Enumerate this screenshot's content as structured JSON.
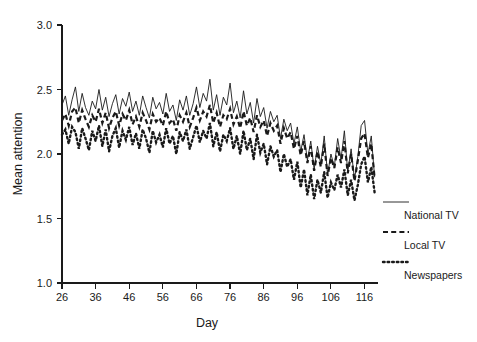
{
  "chart_data": {
    "type": "line",
    "title": "",
    "xlabel": "Day",
    "ylabel": "Mean attention",
    "xlim": [
      26,
      120
    ],
    "ylim": [
      1.0,
      3.0
    ],
    "yticks": [
      "1.0",
      "1.5",
      "2.0",
      "2.5",
      "3.0"
    ],
    "ytick_values": [
      1.0,
      1.5,
      2.0,
      2.5,
      3.0
    ],
    "xticks": [
      "26",
      "36",
      "46",
      "56",
      "66",
      "76",
      "86",
      "96",
      "106",
      "116"
    ],
    "xtick_values": [
      26,
      36,
      46,
      56,
      66,
      76,
      86,
      96,
      106,
      116
    ],
    "grid": false,
    "legend_position": "right",
    "x": [
      26,
      27,
      28,
      29,
      30,
      31,
      32,
      33,
      34,
      35,
      36,
      37,
      38,
      39,
      40,
      41,
      42,
      43,
      44,
      45,
      46,
      47,
      48,
      49,
      50,
      51,
      52,
      53,
      54,
      55,
      56,
      57,
      58,
      59,
      60,
      61,
      62,
      63,
      64,
      65,
      66,
      67,
      68,
      69,
      70,
      71,
      72,
      73,
      74,
      75,
      76,
      77,
      78,
      79,
      80,
      81,
      82,
      83,
      84,
      85,
      86,
      87,
      88,
      89,
      90,
      91,
      92,
      93,
      94,
      95,
      96,
      97,
      98,
      99,
      100,
      101,
      102,
      103,
      104,
      105,
      106,
      107,
      108,
      109,
      110,
      111,
      112,
      113,
      114,
      115,
      116,
      117,
      118,
      119
    ],
    "series": [
      {
        "name": "National TV",
        "style": "solid",
        "color": "#1a1a1a",
        "values": [
          2.38,
          2.45,
          2.3,
          2.42,
          2.52,
          2.33,
          2.47,
          2.36,
          2.3,
          2.41,
          2.35,
          2.5,
          2.34,
          2.44,
          2.29,
          2.39,
          2.46,
          2.31,
          2.43,
          2.37,
          2.48,
          2.33,
          2.41,
          2.3,
          2.45,
          2.36,
          2.28,
          2.44,
          2.35,
          2.4,
          2.31,
          2.47,
          2.33,
          2.38,
          2.26,
          2.42,
          2.34,
          2.45,
          2.3,
          2.39,
          2.52,
          2.36,
          2.47,
          2.41,
          2.58,
          2.34,
          2.46,
          2.3,
          2.44,
          2.38,
          2.55,
          2.32,
          2.41,
          2.28,
          2.49,
          2.31,
          2.4,
          2.24,
          2.43,
          2.29,
          2.36,
          2.2,
          2.33,
          2.25,
          2.3,
          2.12,
          2.27,
          2.18,
          2.24,
          2.08,
          2.21,
          2.02,
          2.15,
          1.95,
          2.1,
          1.88,
          2.06,
          1.92,
          2.14,
          1.84,
          2.0,
          1.9,
          2.12,
          1.96,
          2.18,
          1.86,
          2.04,
          1.8,
          1.98,
          2.22,
          2.26,
          2.0,
          2.14,
          1.82
        ]
      },
      {
        "name": "Local TV",
        "style": "dashed",
        "color": "#1a1a1a",
        "values": [
          2.26,
          2.31,
          2.22,
          2.33,
          2.36,
          2.24,
          2.34,
          2.27,
          2.21,
          2.3,
          2.25,
          2.35,
          2.24,
          2.32,
          2.2,
          2.28,
          2.33,
          2.22,
          2.31,
          2.26,
          2.34,
          2.23,
          2.29,
          2.21,
          2.32,
          2.26,
          2.19,
          2.31,
          2.25,
          2.28,
          2.22,
          2.33,
          2.24,
          2.27,
          2.18,
          2.3,
          2.25,
          2.32,
          2.21,
          2.28,
          2.36,
          2.26,
          2.33,
          2.29,
          2.38,
          2.24,
          2.32,
          2.21,
          2.3,
          2.27,
          2.35,
          2.23,
          2.29,
          2.2,
          2.33,
          2.22,
          2.28,
          2.17,
          2.3,
          2.21,
          2.26,
          2.14,
          2.24,
          2.18,
          2.22,
          2.08,
          2.2,
          2.12,
          2.17,
          2.04,
          2.14,
          1.99,
          2.1,
          1.93,
          2.06,
          1.87,
          2.02,
          1.9,
          2.08,
          1.83,
          1.97,
          1.89,
          2.05,
          1.93,
          2.1,
          1.85,
          2.0,
          1.79,
          1.95,
          2.12,
          2.16,
          1.97,
          2.08,
          1.81
        ]
      },
      {
        "name": "Newspapers",
        "style": "dotted",
        "color": "#1a1a1a",
        "values": [
          2.15,
          2.19,
          2.08,
          2.21,
          2.17,
          2.04,
          2.2,
          2.12,
          2.03,
          2.18,
          2.1,
          2.22,
          2.06,
          2.19,
          2.02,
          2.14,
          2.2,
          2.05,
          2.18,
          2.11,
          2.21,
          2.07,
          2.16,
          2.04,
          2.19,
          2.12,
          2.01,
          2.18,
          2.09,
          2.15,
          2.05,
          2.2,
          2.08,
          2.14,
          2.0,
          2.17,
          2.1,
          2.19,
          2.04,
          2.13,
          2.22,
          2.09,
          2.18,
          2.12,
          2.24,
          2.06,
          2.17,
          2.02,
          2.15,
          2.1,
          2.2,
          2.04,
          2.14,
          2.0,
          2.18,
          2.03,
          2.12,
          1.96,
          2.15,
          2.01,
          2.08,
          1.92,
          2.06,
          1.98,
          2.03,
          1.86,
          2.0,
          1.9,
          1.96,
          1.8,
          1.94,
          1.74,
          1.88,
          1.68,
          1.84,
          1.65,
          1.8,
          1.7,
          1.86,
          1.66,
          1.78,
          1.72,
          1.84,
          1.74,
          1.88,
          1.68,
          1.8,
          1.64,
          1.76,
          1.92,
          1.98,
          1.78,
          1.9,
          1.7
        ]
      }
    ]
  },
  "axis": {
    "ylabel": "Mean attention",
    "xlabel": "Day",
    "ytick_labels": [
      "3.0",
      "2.5",
      "2.0",
      "1.5",
      "1.0"
    ],
    "xtick_labels": [
      "26",
      "36",
      "46",
      "56",
      "66",
      "76",
      "86",
      "96",
      "106",
      "116"
    ]
  },
  "legend": {
    "items": [
      {
        "label": "National TV",
        "style": "solid"
      },
      {
        "label": "Local TV",
        "style": "dashed"
      },
      {
        "label": "Newspapers",
        "style": "dotted"
      }
    ]
  }
}
